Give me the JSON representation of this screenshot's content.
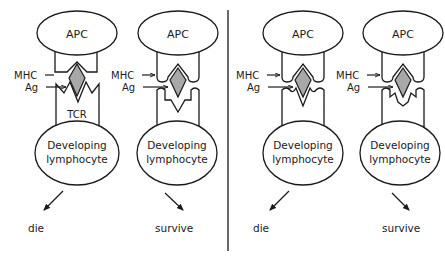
{
  "diagram": {
    "colors": {
      "line": "#1a1a1a",
      "antigen_fill": "#a8a8a8",
      "background": "#ffffff"
    },
    "divider": {
      "x": 228
    },
    "panels": [
      {
        "id": "panel-1",
        "apc_label": "APC",
        "mhc_label": "MHC",
        "ag_label": "Ag",
        "tcr_label": "TCR",
        "cell_label_line1": "Developing",
        "cell_label_line2": "lymphocyte",
        "outcome": "die",
        "binding": "strong"
      },
      {
        "id": "panel-2",
        "apc_label": "APC",
        "mhc_label": "MHC",
        "ag_label": "Ag",
        "tcr_label": "",
        "cell_label_line1": "Developing",
        "cell_label_line2": "lymphocyte",
        "outcome": "survive",
        "binding": "weak"
      },
      {
        "id": "panel-3",
        "apc_label": "APC",
        "mhc_label": "MHC",
        "ag_label": "Ag",
        "tcr_label": "",
        "cell_label_line1": "Developing",
        "cell_label_line2": "lymphocyte",
        "outcome": "die",
        "binding": "strong"
      },
      {
        "id": "panel-4",
        "apc_label": "APC",
        "mhc_label": "MHC",
        "ag_label": "Ag",
        "tcr_label": "",
        "cell_label_line1": "Developing",
        "cell_label_line2": "lymphocyte",
        "outcome": "survive",
        "binding": "weak"
      }
    ]
  }
}
